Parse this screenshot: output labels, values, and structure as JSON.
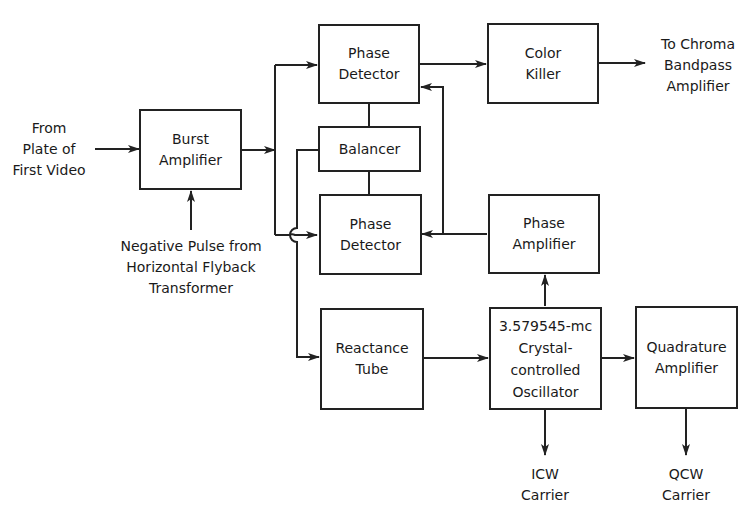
{
  "diagram": {
    "type": "block-diagram",
    "blocks": {
      "burst_amplifier": {
        "line1": "Burst",
        "line2": "Amplifier"
      },
      "phase_detector_top": {
        "line1": "Phase",
        "line2": "Detector"
      },
      "color_killer": {
        "line1": "Color",
        "line2": "Killer"
      },
      "balancer": {
        "line1": "Balancer"
      },
      "phase_detector_bottom": {
        "line1": "Phase",
        "line2": "Detector"
      },
      "phase_amplifier": {
        "line1": "Phase",
        "line2": "Amplifier"
      },
      "reactance_tube": {
        "line1": "Reactance",
        "line2": "Tube"
      },
      "oscillator": {
        "line1": "3.579545-mc",
        "line2": "Crystal-",
        "line3": "controlled",
        "line4": "Oscillator"
      },
      "quadrature_amplifier": {
        "line1": "Quadrature",
        "line2": "Amplifier"
      }
    },
    "labels": {
      "input_source": {
        "line1": "From",
        "line2": "Plate of",
        "line3": "First Video"
      },
      "pulse_source": {
        "line1": "Negative Pulse from",
        "line2": "Horizontal Flyback",
        "line3": "Transformer"
      },
      "chroma_output": {
        "line1": "To Chroma",
        "line2": "Bandpass",
        "line3": "Amplifier"
      },
      "icw_output": {
        "line1": "ICW",
        "line2": "Carrier"
      },
      "qcw_output": {
        "line1": "QCW",
        "line2": "Carrier"
      }
    },
    "connections": [
      {
        "from": "input_source",
        "to": "burst_amplifier"
      },
      {
        "from": "pulse_source",
        "to": "burst_amplifier"
      },
      {
        "from": "burst_amplifier",
        "to": "phase_detector_top"
      },
      {
        "from": "burst_amplifier",
        "to": "phase_detector_bottom"
      },
      {
        "from": "phase_detector_top",
        "to": "color_killer"
      },
      {
        "from": "color_killer",
        "to": "chroma_output"
      },
      {
        "from": "phase_detector_top",
        "to": "balancer"
      },
      {
        "from": "balancer",
        "to": "phase_detector_bottom"
      },
      {
        "from": "balancer",
        "to": "reactance_tube"
      },
      {
        "from": "phase_amplifier",
        "to": "phase_detector_bottom"
      },
      {
        "from": "phase_amplifier",
        "to": "phase_detector_top"
      },
      {
        "from": "reactance_tube",
        "to": "oscillator"
      },
      {
        "from": "oscillator",
        "to": "phase_amplifier"
      },
      {
        "from": "oscillator",
        "to": "quadrature_amplifier"
      },
      {
        "from": "oscillator",
        "to": "icw_output"
      },
      {
        "from": "quadrature_amplifier",
        "to": "qcw_output"
      }
    ]
  }
}
